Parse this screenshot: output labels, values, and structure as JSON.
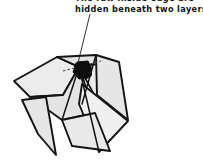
{
  "figure": {
    "caption": {
      "lines": [
        "The raw inside edge are",
        "hidden beneath two layers."
      ],
      "line1": "The raw inside edge are",
      "line2": "hidden beneath two layers.",
      "text_color": "#111111",
      "clipped_top": true
    },
    "leader": {
      "name": "pointer-line",
      "from_x": 90,
      "from_y": 14,
      "to_x": 78,
      "to_y": 63,
      "color": "#1a1a1a",
      "width": 0.9
    },
    "marker": {
      "name": "hidden-edge-marker",
      "shape": "ink-blob",
      "center_x": 83,
      "center_y": 71,
      "color": "#0d0d0d"
    },
    "crease_hint": {
      "name": "hidden-edge-dashed-line",
      "style": "dashed",
      "color": "#3a3a3a",
      "from_x": 63,
      "from_y": 70,
      "to_x": 100,
      "to_y": 61
    },
    "palette": {
      "paper_light": "#ececec",
      "paper_mid": "#e2e2e2",
      "paper_shadow": "#d6d6d6",
      "paper_white": "#f7f7f7",
      "outline": "#141414",
      "background": "#ffffff",
      "ink": "#0d0d0d"
    },
    "facets": [
      {
        "name": "facet-upper-left-wing",
        "points": "14,81 57,57 79,67 63,95 30,97",
        "fill": "#ececec"
      },
      {
        "name": "facet-main-body-top",
        "points": "57,57 96,55 106,63 79,67",
        "fill": "#e2e2e2"
      },
      {
        "name": "facet-central-panel",
        "points": "30,97 63,95 79,67 95,113 62,120",
        "fill": "#e4e4e4"
      },
      {
        "name": "facet-right-upper-flap",
        "points": "79,67 106,63 116,70 96,98",
        "fill": "#ececec"
      },
      {
        "name": "facet-right-long-point",
        "points": "96,55 119,62 128,120 97,95",
        "fill": "#e6e6e6"
      },
      {
        "name": "facet-lower-right-spike",
        "points": "82,84 128,121 99,152 79,104",
        "fill": "#efefef"
      },
      {
        "name": "facet-lower-left-spike",
        "points": "62,120 95,113 110,151 72,146",
        "fill": "#e9e9e9"
      },
      {
        "name": "facet-left-narrow-flap",
        "points": "22,100 46,97 56,155 38,134",
        "fill": "#e6e6e6"
      }
    ],
    "creases": [
      {
        "name": "crease-body-spine",
        "from_x": 57,
        "from_y": 57,
        "to_x": 79,
        "to_y": 67
      },
      {
        "name": "crease-center-fold",
        "from_x": 79,
        "from_y": 67,
        "to_x": 62,
        "to_y": 120
      },
      {
        "name": "crease-right-inner",
        "from_x": 96,
        "from_y": 55,
        "to_x": 82,
        "to_y": 104
      },
      {
        "name": "crease-left-wing-edge",
        "from_x": 30,
        "from_y": 97,
        "to_x": 63,
        "to_y": 95
      }
    ]
  }
}
